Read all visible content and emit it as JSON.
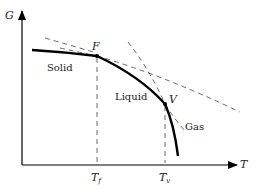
{
  "diagram": {
    "axes": {
      "y_label": "G",
      "x_label": "T"
    },
    "points": {
      "fusion": {
        "label": "F"
      },
      "vaporization": {
        "label": "V"
      }
    },
    "ticks": {
      "fusion_temp": {
        "base": "T",
        "sub": "f"
      },
      "vapor_temp": {
        "base": "T",
        "sub": "v"
      }
    },
    "phases": {
      "solid": "Solid",
      "liquid": "Liquid",
      "gas": "Gas"
    },
    "colors": {
      "curve": "#000000",
      "dashed": "#444444",
      "text": "#222222"
    }
  }
}
